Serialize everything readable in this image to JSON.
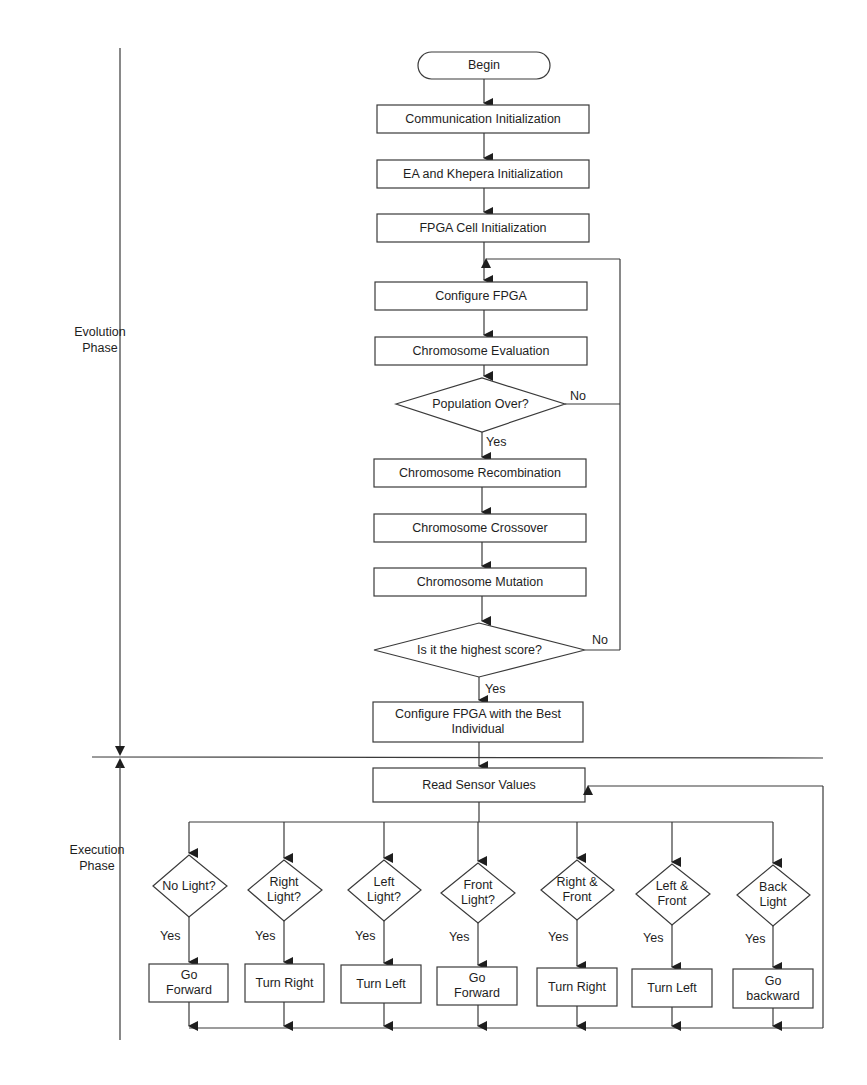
{
  "phases": {
    "evolution": "Evolution Phase",
    "execution": "Execution Phase"
  },
  "evolution_flow": {
    "begin": "Begin",
    "communication_init": "Communication Initialization",
    "ea_khepera_init": "EA and Khepera Initialization",
    "fpga_cell_init": "FPGA Cell Initialization",
    "configure_fpga": "Configure FPGA",
    "chromosome_evaluation": "Chromosome Evaluation",
    "population_over": "Population Over?",
    "population_over_no": "No",
    "population_over_yes": "Yes",
    "chromosome_recombination": "Chromosome Recombination",
    "chromosome_crossover": "Chromosome Crossover",
    "chromosome_mutation": "Chromosome Mutation",
    "highest_score": "Is it the highest score?",
    "highest_score_no": "No",
    "highest_score_yes": "Yes",
    "configure_best": "Configure FPGA with the Best Individual"
  },
  "execution_flow": {
    "read_sensor": "Read Sensor Values",
    "branches": [
      {
        "condition": "No Light?",
        "yes": "Yes",
        "action": "Go Forward"
      },
      {
        "condition": "Right Light?",
        "yes": "Yes",
        "action": "Turn Right"
      },
      {
        "condition": "Left Light?",
        "yes": "Yes",
        "action": "Turn Left"
      },
      {
        "condition": "Front Light?",
        "yes": "Yes",
        "action": "Go Forward"
      },
      {
        "condition": "Right & Front",
        "yes": "Yes",
        "action": "Turn Right"
      },
      {
        "condition": "Left & Front",
        "yes": "Yes",
        "action": "Turn Left"
      },
      {
        "condition": "Back Light",
        "yes": "Yes",
        "action": "Go backward"
      }
    ]
  },
  "colors": {
    "stroke": "#3a3a3a",
    "text": "#1e1e1e",
    "background": "#ffffff"
  }
}
